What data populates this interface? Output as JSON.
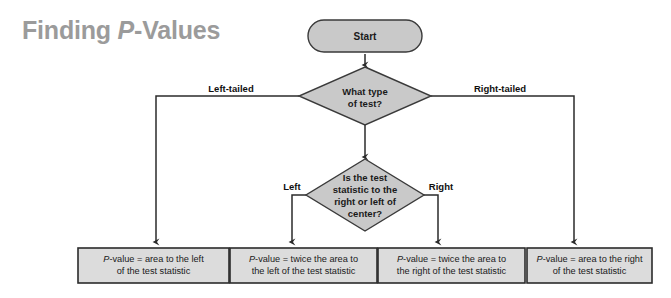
{
  "title": {
    "prefix": "Finding ",
    "italic": "P",
    "suffix": "-Values",
    "color": "#9b9b9b"
  },
  "colors": {
    "node_fill": "#c9c9c9",
    "box_fill": "#dcdcdc",
    "stroke": "#2b2b2b",
    "text": "#1a1a1a",
    "background": "#ffffff"
  },
  "nodes": {
    "start": {
      "label": "Start",
      "shape": "stadium"
    },
    "decision1": {
      "shape": "diamond",
      "lines": [
        "What type",
        "of test?"
      ]
    },
    "decision2": {
      "shape": "diamond",
      "lines": [
        "Is the test",
        "statistic to the",
        "right or left of",
        "center?"
      ]
    }
  },
  "edge_labels": {
    "left_tailed": "Left-tailed",
    "right_tailed": "Right-tailed",
    "left": "Left",
    "right": "Right"
  },
  "outcomes": [
    {
      "id": "left-tailed-outcome",
      "line1_prefix": "P",
      "line1_rest": "-value = area to the left",
      "line2": "of the test statistic"
    },
    {
      "id": "two-tailed-left-outcome",
      "line1_prefix": "P",
      "line1_rest": "-value = twice the area to",
      "line2": "the left of the test statistic"
    },
    {
      "id": "two-tailed-right-outcome",
      "line1_prefix": "P",
      "line1_rest": "-value = twice the area to",
      "line2": "the right of the test statistic"
    },
    {
      "id": "right-tailed-outcome",
      "line1_prefix": "P",
      "line1_rest": "-value = area to the right",
      "line2": "of the test statistic"
    }
  ]
}
